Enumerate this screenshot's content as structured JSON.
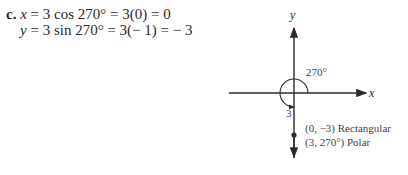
{
  "problem": {
    "label": "c.",
    "line1": {
      "var": "x",
      "rest": " = 3 cos 270° = 3(0) = 0"
    },
    "line2": {
      "var": "y",
      "rest": " = 3 sin 270° = 3(− 1) = − 3"
    }
  },
  "figure": {
    "x_axis_label": "x",
    "y_axis_label": "y",
    "angle_label": "270°",
    "radius_label": "3",
    "point_rect_label": "(0, −3) Rectangular",
    "point_polar_label": "(3, 270°) Polar",
    "point": {
      "r": 3,
      "theta_deg": 270,
      "x": 0,
      "y": -3
    },
    "colors": {
      "stroke": "#2a2a2a"
    }
  }
}
